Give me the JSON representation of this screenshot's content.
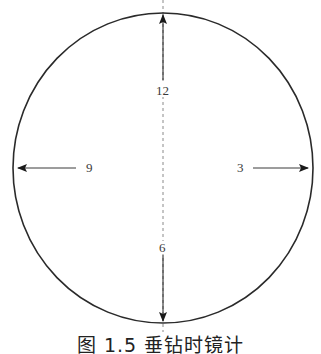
{
  "figure": {
    "caption": "图 1.5 垂钻时镜计",
    "colors": {
      "stroke": "#2a2a2a",
      "dashed_axis": "#8a8a8a",
      "text": "#3a3a3a"
    },
    "circle": {
      "cx": 163,
      "cy": 168,
      "rx": 150,
      "ry": 155
    },
    "clock_labels": {
      "twelve": "12",
      "three": "3",
      "six": "6",
      "nine": "9"
    },
    "arrows": [
      {
        "label": "12",
        "direction": "up"
      },
      {
        "label": "3",
        "direction": "right"
      },
      {
        "label": "6",
        "direction": "down"
      },
      {
        "label": "9",
        "direction": "left"
      }
    ]
  }
}
